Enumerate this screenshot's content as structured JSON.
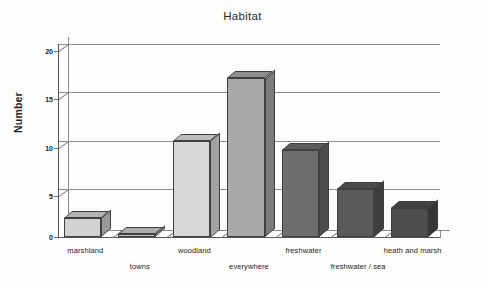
{
  "chart_data": {
    "type": "bar",
    "title": "Habitat",
    "xlabel": "",
    "ylabel": "Number",
    "categories": [
      "marshland",
      "towns",
      "woodland",
      "everywhere",
      "freshwater",
      "freshwater / sea",
      "heath and marsh"
    ],
    "values": [
      2,
      0.3,
      10,
      16.5,
      9,
      5,
      3
    ],
    "ylim": [
      0,
      20
    ],
    "yticks": [
      0,
      5,
      10,
      15,
      20
    ],
    "ytick_labels": [
      "0",
      "5",
      "10",
      "15",
      "20"
    ],
    "grid": true,
    "legend": false,
    "style": "3d-extruded-bars-grayscale",
    "bar_colors": [
      "#d2d2d2",
      "#c9c9c9",
      "#d8d8d8",
      "#a8a8a8",
      "#6e6e6e",
      "#5a5a5a",
      "#4f4f4f"
    ],
    "bar_top_colors": [
      "#b4b4b4",
      "#acacac",
      "#bcbcbc",
      "#909090",
      "#5c5c5c",
      "#4a4a4a",
      "#414141"
    ],
    "bar_side_colors": [
      "#9a9a9a",
      "#939393",
      "#a2a2a2",
      "#7b7b7b",
      "#4d4d4d",
      "#3e3e3e",
      "#363636"
    ],
    "axis_color": "#555555",
    "grid_color": "#8d8d8d",
    "background": "#fdfdfc"
  }
}
